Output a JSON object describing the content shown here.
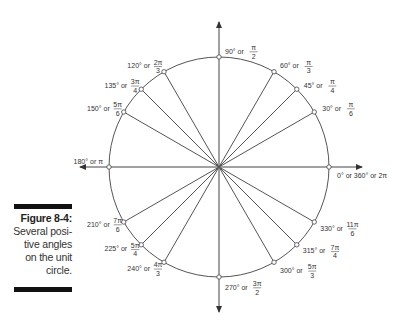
{
  "figure": {
    "title": "Figure 8-4:",
    "caption": "Several positive angles on the unit circle.",
    "caption_lines": [
      "Several posi-",
      "tive angles",
      "on the unit",
      "circle."
    ]
  },
  "diagram": {
    "type": "unit-circle",
    "center": [
      219,
      167
    ],
    "radius": 110,
    "angles": [
      {
        "deg": 0,
        "label_deg": "0° or 360° or 2π",
        "num": "",
        "den": ""
      },
      {
        "deg": 30,
        "label_deg": "30° or",
        "num": "π",
        "den": "6"
      },
      {
        "deg": 45,
        "label_deg": "45° or",
        "num": "π",
        "den": "4"
      },
      {
        "deg": 60,
        "label_deg": "60° or",
        "num": "π",
        "den": "3"
      },
      {
        "deg": 90,
        "label_deg": "90° or",
        "num": "π",
        "den": "2"
      },
      {
        "deg": 120,
        "label_deg": "120° or",
        "num": "2π",
        "den": "3"
      },
      {
        "deg": 135,
        "label_deg": "135° or",
        "num": "3π",
        "den": "4"
      },
      {
        "deg": 150,
        "label_deg": "150° or",
        "num": "5π",
        "den": "6"
      },
      {
        "deg": 180,
        "label_deg": "180° or π",
        "num": "",
        "den": ""
      },
      {
        "deg": 210,
        "label_deg": "210° or",
        "num": "7π",
        "den": "6"
      },
      {
        "deg": 225,
        "label_deg": "225° or",
        "num": "5π",
        "den": "4"
      },
      {
        "deg": 240,
        "label_deg": "240° or",
        "num": "4π",
        "den": "3"
      },
      {
        "deg": 270,
        "label_deg": "270° or",
        "num": "3π",
        "den": "2"
      },
      {
        "deg": 300,
        "label_deg": "300° or",
        "num": "5π",
        "den": "3"
      },
      {
        "deg": 315,
        "label_deg": "315° or",
        "num": "7π",
        "den": "4"
      },
      {
        "deg": 330,
        "label_deg": "330° or",
        "num": "11π",
        "den": "6"
      }
    ],
    "colors": {
      "line": "#555555",
      "text": "#333333",
      "bar": "#111111"
    }
  }
}
